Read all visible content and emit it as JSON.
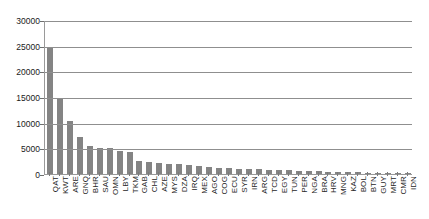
{
  "chart_data": {
    "type": "bar",
    "title": "",
    "subtitle": "",
    "xlabel": "",
    "ylabel": "",
    "ylim": [
      0,
      30000
    ],
    "ytick_labels": [
      "0",
      "5000",
      "10000",
      "15000",
      "20000",
      "25000",
      "30000"
    ],
    "ytick_values": [
      0,
      5000,
      10000,
      15000,
      20000,
      25000,
      30000
    ],
    "grid": true,
    "legend": false,
    "legend_position": "none",
    "bar_color": "#848484",
    "axis_color": "#8f8f8f",
    "categories": [
      "QAT",
      "KWT",
      "ARE",
      "GNQ",
      "BHR",
      "SAU",
      "OMN",
      "LBY",
      "TKM",
      "GAB",
      "CHL",
      "AZE",
      "MYS",
      "DZA",
      "IRQ",
      "MEX",
      "AGO",
      "COG",
      "ECU",
      "SYR",
      "IRN",
      "ARG",
      "TCD",
      "EGY",
      "TUN",
      "PER",
      "NGA",
      "BRA",
      "HRV",
      "MNG",
      "KAZ",
      "BOL",
      "BTN",
      "GUY",
      "MRT",
      "CMR",
      "IDN"
    ],
    "values": [
      24600,
      14800,
      10400,
      7200,
      5400,
      5100,
      5000,
      4500,
      4200,
      2600,
      2400,
      2200,
      2000,
      1900,
      1800,
      1500,
      1300,
      1200,
      1100,
      1000,
      950,
      900,
      820,
      760,
      700,
      640,
      580,
      520,
      470,
      420,
      370,
      320,
      280,
      230,
      190,
      150,
      110
    ]
  }
}
